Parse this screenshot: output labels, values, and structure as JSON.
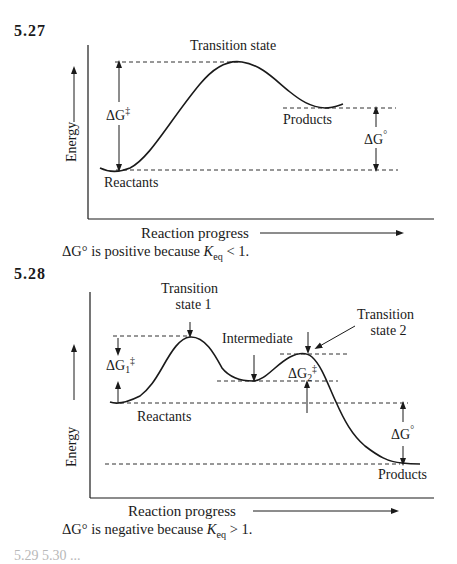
{
  "problem_1": {
    "number": "5.27",
    "axis": {
      "y_label": "Energy",
      "x_label": "Reaction progress"
    },
    "labels": {
      "transition_state": "Transition state",
      "products": "Products",
      "reactants": "Reactants",
      "activation_energy": {
        "delta": "ΔG",
        "superscript": "‡"
      },
      "free_energy_change": {
        "delta": "ΔG",
        "superscript": "°"
      }
    },
    "caption": {
      "prefix": "ΔG",
      "degree": "°",
      "middle": " is positive because ",
      "k": "K",
      "k_sub": "eq",
      "suffix": " < 1."
    }
  },
  "problem_2": {
    "number": "5.28",
    "axis": {
      "y_label": "Energy",
      "x_label": "Reaction progress"
    },
    "labels": {
      "transition_state_1_line1": "Transition",
      "transition_state_1_line2": "state 1",
      "intermediate": "Intermediate",
      "transition_state_2_line1": "Transition",
      "transition_state_2_line2": "state 2",
      "reactants": "Reactants",
      "products": "Products",
      "activation_energy_1": {
        "delta": "ΔG",
        "sub": "1",
        "superscript": "‡"
      },
      "activation_energy_2": {
        "delta": "ΔG",
        "sub": "2",
        "superscript": "‡"
      },
      "free_energy_change": {
        "delta": "ΔG",
        "superscript": "°"
      }
    },
    "caption": {
      "prefix": "ΔG",
      "degree": "°",
      "middle": " is negative because ",
      "k": "K",
      "k_sub": "eq",
      "suffix": " > 1."
    }
  },
  "footer_cutoff_text": "5.29  5.30 ..."
}
